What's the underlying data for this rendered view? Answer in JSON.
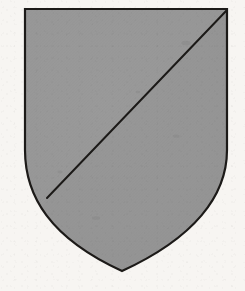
{
  "image": {
    "kind": "heraldic-illustration",
    "subject": "coat of arms shield",
    "title": "Shield divided per bend",
    "width_px": 245,
    "height_px": 291,
    "background_color": "#f7f5f2",
    "caption": ""
  },
  "shield": {
    "name": "escutcheon",
    "outline_color": "#1c1a18",
    "outline_width_px": 2.2,
    "fill_color": "#969696",
    "geometry": {
      "top_left": [
        25,
        9
      ],
      "top_right": [
        227,
        9
      ],
      "bottom_point": [
        122,
        271
      ],
      "left_edge_straight_to_y": 150,
      "right_edge_straight_to_y": 150,
      "path": "M25,9 L227,9 L227,150 C227,196 194,238 122,271 C50,238 25,196 25,150 Z"
    },
    "tincture_label": "grey (hatched / tinted)"
  },
  "divisions": [
    {
      "name": "bend-line",
      "description": "diagonal line from dexter chief to sinister base",
      "start": [
        227,
        9
      ],
      "end": [
        47,
        198
      ],
      "color": "#1c1a18",
      "width_px": 2.0
    }
  ],
  "fields": [
    {
      "name": "upper-left-field",
      "position": "sinister chief / upper-left of the bend",
      "fill_color": "#989898"
    },
    {
      "name": "lower-right-field",
      "position": "dexter base / lower-right of the bend",
      "fill_color": "#949494"
    }
  ]
}
